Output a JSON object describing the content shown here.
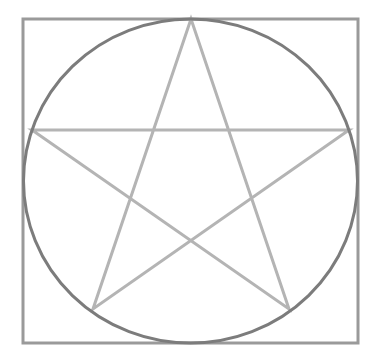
{
  "diagram": {
    "title": "",
    "background": "#ffffff",
    "square": {
      "x": 23,
      "y": 19,
      "width": 335,
      "height": 324,
      "stroke": "#9a9a9a",
      "stroke_width": 3
    },
    "circle": {
      "cx": 190.5,
      "cy": 181,
      "rx": 167,
      "ry": 162,
      "stroke": "#7c7c7c",
      "stroke_width": 3
    },
    "star": {
      "stroke": "#b4b4b4",
      "stroke_width": 3,
      "points": [
        {
          "name": "top",
          "x": 191,
          "y": 19
        },
        {
          "name": "bottom-right",
          "x": 289,
          "y": 309
        },
        {
          "name": "left",
          "x": 32,
          "y": 130
        },
        {
          "name": "right",
          "x": 349,
          "y": 130
        },
        {
          "name": "bottom-left",
          "x": 93,
          "y": 309
        }
      ]
    }
  }
}
